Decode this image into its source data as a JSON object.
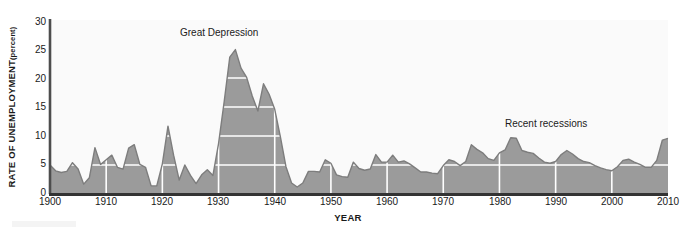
{
  "chart_data": {
    "type": "area",
    "title": "",
    "xlabel": "YEAR",
    "ylabel": "RATE OF UNEMPLOYMENT",
    "ylabel_unit": "(percent)",
    "ylim": [
      0,
      30
    ],
    "xlim": [
      1900,
      2010
    ],
    "yticks": [
      30,
      25,
      20,
      15,
      10,
      5,
      0
    ],
    "xticks": [
      1900,
      1910,
      1920,
      1930,
      1940,
      1950,
      1960,
      1970,
      1980,
      1990,
      2000,
      2010
    ],
    "grid": "white gridlines on filled area only, vertical at decades and horizontal at 5-unit steps",
    "legend": "none",
    "series_name": "Rate of unemployment",
    "fill_color": "#9b9b9b",
    "line_color": "#7d7d7d",
    "grid_color": "#ffffff",
    "plot_background": "#fafafa",
    "axis_color": "#4d4d4d",
    "annotations": [
      {
        "text": "Great Depression",
        "x": 1931,
        "y": 29
      },
      {
        "text": "Recent recessions",
        "x": 1987,
        "y": 15.5
      }
    ],
    "x": [
      1900,
      1901,
      1902,
      1903,
      1904,
      1905,
      1906,
      1907,
      1908,
      1909,
      1910,
      1911,
      1912,
      1913,
      1914,
      1915,
      1916,
      1917,
      1918,
      1919,
      1920,
      1921,
      1922,
      1923,
      1924,
      1925,
      1926,
      1927,
      1928,
      1929,
      1930,
      1931,
      1932,
      1933,
      1934,
      1935,
      1936,
      1937,
      1938,
      1939,
      1940,
      1941,
      1942,
      1943,
      1944,
      1945,
      1946,
      1947,
      1948,
      1949,
      1950,
      1951,
      1952,
      1953,
      1954,
      1955,
      1956,
      1957,
      1958,
      1959,
      1960,
      1961,
      1962,
      1963,
      1964,
      1965,
      1966,
      1967,
      1968,
      1969,
      1970,
      1971,
      1972,
      1973,
      1974,
      1975,
      1976,
      1977,
      1978,
      1979,
      1980,
      1981,
      1982,
      1983,
      1984,
      1985,
      1986,
      1987,
      1988,
      1989,
      1990,
      1991,
      1992,
      1993,
      1994,
      1995,
      1996,
      1997,
      1998,
      1999,
      2000,
      2001,
      2002,
      2003,
      2004,
      2005,
      2006,
      2007,
      2008,
      2009,
      2010
    ],
    "values": [
      5.0,
      4.0,
      3.7,
      3.9,
      5.4,
      4.3,
      1.7,
      2.8,
      8.0,
      5.1,
      5.9,
      6.7,
      4.6,
      4.3,
      7.9,
      8.5,
      5.1,
      4.6,
      1.4,
      1.4,
      5.2,
      11.7,
      6.7,
      2.4,
      5.0,
      3.2,
      1.8,
      3.3,
      4.2,
      3.2,
      8.7,
      15.9,
      23.6,
      24.9,
      21.7,
      20.1,
      16.9,
      14.3,
      19.0,
      17.2,
      14.6,
      9.9,
      4.7,
      1.9,
      1.2,
      1.9,
      3.9,
      3.9,
      3.8,
      5.9,
      5.3,
      3.3,
      3.0,
      2.9,
      5.5,
      4.4,
      4.1,
      4.3,
      6.8,
      5.5,
      5.5,
      6.7,
      5.5,
      5.7,
      5.2,
      4.5,
      3.8,
      3.8,
      3.6,
      3.5,
      4.9,
      5.9,
      5.6,
      4.9,
      5.6,
      8.5,
      7.7,
      7.1,
      6.1,
      5.8,
      7.1,
      7.6,
      9.7,
      9.6,
      7.5,
      7.2,
      7.0,
      6.2,
      5.5,
      5.3,
      5.6,
      6.8,
      7.5,
      6.9,
      6.1,
      5.6,
      5.4,
      4.9,
      4.5,
      4.2,
      4.0,
      4.7,
      5.8,
      6.0,
      5.5,
      5.1,
      4.6,
      4.6,
      5.8,
      9.3,
      9.6
    ]
  }
}
